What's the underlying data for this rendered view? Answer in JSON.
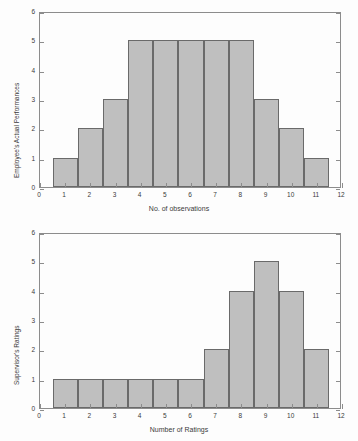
{
  "figure": {
    "background_color": "#fdfdfd",
    "bar_fill_color": "#bfbfbf",
    "bar_edge_color": "#6a6a6a",
    "axis_color": "#8c8c8c"
  },
  "chart_data": [
    {
      "id": "employee-actual-performances",
      "type": "bar",
      "title": "",
      "xlabel": "No. of observations",
      "ylabel": "Employee's Actual Performances",
      "categories": [
        1,
        2,
        3,
        4,
        5,
        6,
        7,
        8,
        9,
        10,
        11
      ],
      "values": [
        1,
        2,
        3,
        5,
        5,
        5,
        5,
        5,
        3,
        2,
        1
      ],
      "xlim": [
        0,
        12
      ],
      "ylim": [
        0,
        6
      ],
      "xticks": [
        0,
        1,
        2,
        3,
        4,
        5,
        6,
        7,
        8,
        9,
        10,
        11,
        12
      ],
      "yticks": [
        0,
        1,
        2,
        3,
        4,
        5,
        6
      ],
      "xtick_labels": [
        "0",
        "1",
        "2",
        "3",
        "4",
        "5",
        "6",
        "7",
        "8",
        "9",
        "10",
        "11",
        "12"
      ],
      "ytick_labels": [
        "0",
        "1",
        "2",
        "3",
        "4",
        "5",
        "6"
      ],
      "bar_width": 1,
      "grid": false,
      "legend": null
    },
    {
      "id": "supervisors-ratings",
      "type": "bar",
      "title": "",
      "xlabel": "Number of Ratings",
      "ylabel": "Supervisor's Ratings",
      "categories": [
        1,
        2,
        3,
        4,
        5,
        6,
        7,
        8,
        9,
        10,
        11
      ],
      "values": [
        1,
        1,
        1,
        1,
        1,
        1,
        2,
        4,
        5,
        4,
        2
      ],
      "xlim": [
        0,
        12
      ],
      "ylim": [
        0,
        6
      ],
      "xticks": [
        0,
        1,
        2,
        3,
        4,
        5,
        6,
        7,
        8,
        9,
        10,
        11,
        12
      ],
      "yticks": [
        0,
        1,
        2,
        3,
        4,
        5,
        6
      ],
      "xtick_labels": [
        "0",
        "1",
        "2",
        "3",
        "4",
        "5",
        "6",
        "7",
        "8",
        "9",
        "10",
        "11",
        "12"
      ],
      "ytick_labels": [
        "0",
        "1",
        "2",
        "3",
        "4",
        "5",
        "6"
      ],
      "bar_width": 1,
      "grid": false,
      "legend": null
    }
  ]
}
